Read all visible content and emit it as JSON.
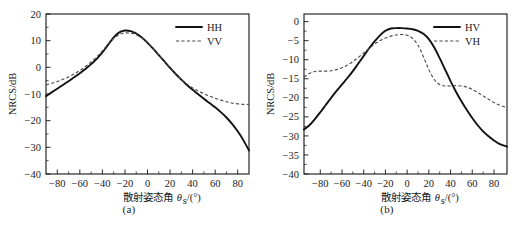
{
  "figure": {
    "panels": [
      {
        "id": "a",
        "caption": "(a)",
        "xlabel_cjk": "散射姿态角",
        "xlabel_sym": "θ",
        "xlabel_sub": "s",
        "xlabel_unit": "/(°)",
        "ylabel": "NRCS/dB",
        "legend": [
          {
            "label": "HH",
            "style": "solid"
          },
          {
            "label": "VV",
            "style": "dashed"
          }
        ]
      },
      {
        "id": "b",
        "caption": "(b)",
        "xlabel_cjk": "散射姿态角",
        "xlabel_sym": "θ",
        "xlabel_sub": "s",
        "xlabel_unit": "/(°)",
        "ylabel": "NRCS/dB",
        "legend": [
          {
            "label": "HV",
            "style": "solid"
          },
          {
            "label": "VH",
            "style": "dashed"
          }
        ]
      }
    ]
  },
  "chart_data": [
    {
      "type": "line",
      "id": "a",
      "title": "(a)",
      "xlabel": "散射姿态角 θs/(°)",
      "ylabel": "NRCS/dB",
      "xlim": [
        -90,
        90
      ],
      "ylim": [
        -40,
        20
      ],
      "xticks": [
        -80,
        -60,
        -40,
        -20,
        0,
        20,
        40,
        60,
        80
      ],
      "xtick_labels": [
        "-80",
        "-60",
        "-40",
        "-20",
        "0",
        "20",
        "40",
        "60",
        "80"
      ],
      "yticks": [
        -40,
        -30,
        -20,
        -10,
        0,
        10,
        20
      ],
      "ytick_labels": [
        "-40",
        "-30",
        "-20",
        "-10",
        "0",
        "10",
        "20"
      ],
      "grid": false,
      "legend_position": "top-right",
      "x": [
        -90,
        -85,
        -80,
        -75,
        -70,
        -65,
        -60,
        -55,
        -50,
        -45,
        -40,
        -35,
        -30,
        -25,
        -20,
        -15,
        -10,
        -5,
        0,
        5,
        10,
        15,
        20,
        25,
        30,
        35,
        40,
        45,
        50,
        55,
        60,
        65,
        70,
        75,
        80,
        85,
        90
      ],
      "series": [
        {
          "name": "HH",
          "style": "solid",
          "values": [
            -10.8,
            -9.4,
            -8.0,
            -6.6,
            -5.2,
            -3.7,
            -2.2,
            -0.6,
            1.2,
            3.2,
            5.6,
            8.4,
            11.2,
            13.1,
            13.8,
            13.6,
            12.7,
            11.2,
            9.2,
            7.0,
            4.6,
            2.2,
            -0.2,
            -2.5,
            -4.6,
            -6.6,
            -8.4,
            -10.1,
            -11.8,
            -13.4,
            -15.0,
            -16.8,
            -18.8,
            -21.2,
            -24.0,
            -27.3,
            -31.2
          ]
        },
        {
          "name": "VV",
          "style": "dashed",
          "values": [
            -6.6,
            -6.0,
            -5.3,
            -4.5,
            -3.6,
            -2.5,
            -1.2,
            0.3,
            2.0,
            4.0,
            6.2,
            8.6,
            10.8,
            12.3,
            12.9,
            12.8,
            12.2,
            11.0,
            9.2,
            7.0,
            4.6,
            2.2,
            -0.3,
            -2.6,
            -4.6,
            -6.3,
            -7.7,
            -8.9,
            -9.9,
            -10.8,
            -11.6,
            -12.3,
            -12.9,
            -13.4,
            -13.7,
            -13.9,
            -13.9
          ]
        }
      ]
    },
    {
      "type": "line",
      "id": "b",
      "title": "(b)",
      "xlabel": "散射姿态角 θs/(°)",
      "ylabel": "NRCS/dB",
      "xlim": [
        -95,
        92
      ],
      "ylim": [
        -40,
        2
      ],
      "xticks": [
        -80,
        -60,
        -40,
        -20,
        0,
        20,
        40,
        60,
        80
      ],
      "xtick_labels": [
        "-80",
        "-60",
        "-40",
        "-20",
        "0",
        "20",
        "40",
        "60",
        "80"
      ],
      "yticks": [
        -40,
        -35,
        -30,
        -25,
        -20,
        -15,
        -10,
        -5,
        0
      ],
      "ytick_labels": [
        "-40",
        "-35",
        "-30",
        "-25",
        "-20",
        "-15",
        "-10",
        "-5",
        "0"
      ],
      "grid": false,
      "legend_position": "top-right",
      "x": [
        -95,
        -90,
        -85,
        -80,
        -75,
        -70,
        -65,
        -60,
        -55,
        -50,
        -45,
        -40,
        -35,
        -30,
        -25,
        -20,
        -15,
        -10,
        -5,
        0,
        5,
        10,
        15,
        20,
        25,
        30,
        35,
        40,
        45,
        50,
        55,
        60,
        65,
        70,
        75,
        80,
        85,
        92
      ],
      "series": [
        {
          "name": "HV",
          "style": "solid",
          "values": [
            -28.3,
            -27.2,
            -25.6,
            -23.8,
            -21.9,
            -20.0,
            -18.2,
            -16.5,
            -14.8,
            -13.0,
            -11.0,
            -9.0,
            -7.0,
            -5.2,
            -3.6,
            -2.4,
            -1.8,
            -1.7,
            -1.7,
            -1.8,
            -2.0,
            -2.4,
            -3.2,
            -4.6,
            -6.8,
            -9.6,
            -12.6,
            -15.6,
            -18.4,
            -20.9,
            -23.2,
            -25.3,
            -27.2,
            -28.8,
            -30.1,
            -31.2,
            -32.1,
            -32.8
          ]
        },
        {
          "name": "VH",
          "style": "dashed",
          "values": [
            -14.6,
            -13.6,
            -13.1,
            -13.0,
            -13.0,
            -12.9,
            -12.6,
            -12.1,
            -11.4,
            -10.5,
            -9.4,
            -8.2,
            -7.0,
            -5.9,
            -5.0,
            -4.3,
            -3.8,
            -3.5,
            -3.4,
            -3.6,
            -4.4,
            -6.2,
            -9.2,
            -12.6,
            -15.2,
            -16.5,
            -16.9,
            -16.9,
            -16.8,
            -16.9,
            -17.2,
            -17.8,
            -18.6,
            -19.5,
            -20.4,
            -21.2,
            -21.9,
            -22.6
          ]
        }
      ]
    }
  ]
}
